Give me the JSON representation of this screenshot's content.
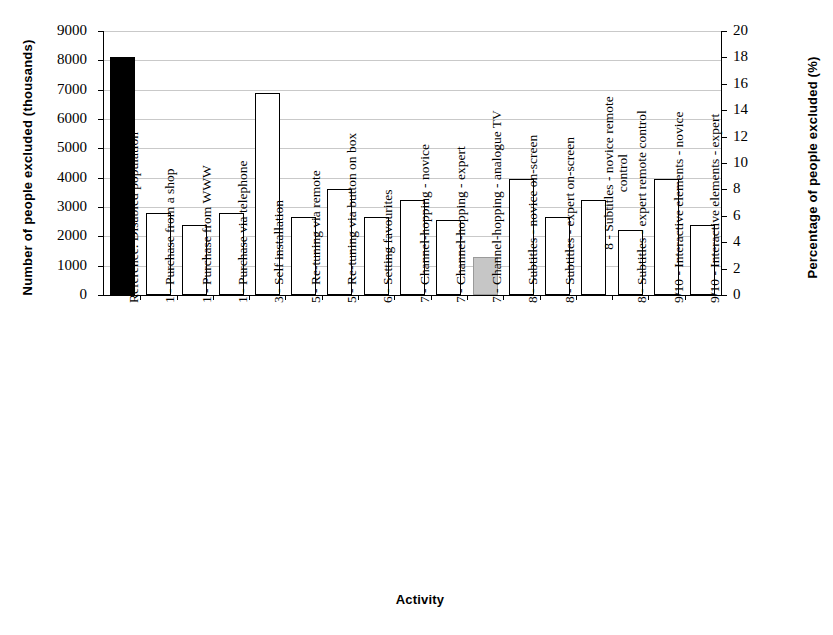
{
  "chart_data": {
    "type": "bar",
    "title": "",
    "xlabel": "Activity",
    "ylabel": "Number of people excluded (thousands)",
    "ylabel_secondary": "Percentage of people excluded (%)",
    "ylim": [
      0,
      9000
    ],
    "ylim_secondary": [
      0,
      20
    ],
    "yticks": [
      0,
      1000,
      2000,
      3000,
      4000,
      5000,
      6000,
      7000,
      8000,
      9000
    ],
    "ytick_labels": [
      "0",
      "1000",
      "2000",
      "3000",
      "4000",
      "5000",
      "6000",
      "7000",
      "8000",
      "9000"
    ],
    "yticks_secondary": [
      0,
      2,
      4,
      6,
      8,
      10,
      12,
      14,
      16,
      18,
      20
    ],
    "ytick_labels_secondary": [
      "0",
      "2",
      "4",
      "6",
      "8",
      "10",
      "12",
      "14",
      "16",
      "18",
      "20"
    ],
    "grid": true,
    "legend": "none",
    "categories": [
      "Reference: Disabled population",
      "1 - Purchase from a shop",
      "1 - Purchase from WWW",
      "1 - Purchase via telephone",
      "3 - Self installation",
      "5 - Re-tuning via remote",
      "5 - Re-tuning via button on box",
      "6 - Setting favourites",
      "7 - Channel-hopping - novice",
      "7 - Channel-hopping - expert",
      "7 - Channel-hopping - analogue TV",
      "8 - Subtitles - novice on-screen",
      "8 - Subtitles - expert on-screen",
      "8 - Subtitles - novice remote\ncontrol",
      "8 - Subtitles - expert remote control",
      "9/10 - Interactive elements - novice",
      "9/10 - Interactive elements - expert"
    ],
    "values": [
      8100,
      2780,
      2400,
      2780,
      6900,
      2650,
      3620,
      2650,
      3230,
      2570,
      1280,
      3960,
      2650,
      3230,
      2200,
      3960,
      2400
    ],
    "values_percent": [
      18.0,
      6.2,
      5.3,
      6.2,
      15.3,
      5.9,
      8.0,
      5.9,
      7.2,
      5.7,
      2.8,
      8.8,
      5.9,
      7.2,
      4.9,
      8.8,
      5.3
    ],
    "bar_styles": [
      "black",
      "white",
      "white",
      "white",
      "white",
      "white",
      "white",
      "white",
      "white",
      "white",
      "gray",
      "white",
      "white",
      "white",
      "white",
      "white",
      "white"
    ],
    "colors": {
      "reference_bar": "#000000",
      "standard_bar_fill": "#ffffff",
      "standard_bar_edge": "#000000",
      "analogue_tv_bar": "#c6c6c6",
      "gridline": "#c9c9c9"
    }
  }
}
